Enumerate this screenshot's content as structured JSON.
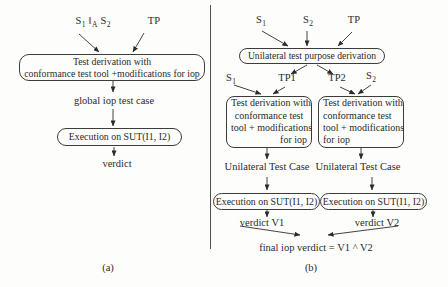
{
  "colors": {
    "ink": "#2b2b2b",
    "line": "#3c3c3c",
    "background": "#fdfdfb"
  },
  "panel_a": {
    "caption": "(a)",
    "inputs": {
      "s1": {
        "base": "S",
        "sub": "1"
      },
      "parallel": {
        "base": "‖",
        "sub": "A"
      },
      "s2": {
        "base": "S",
        "sub": "2"
      },
      "tp": "TP"
    },
    "derivation_box": {
      "line1": "Test derivation with",
      "line2": "conformance test tool +modifications for iop"
    },
    "global_test_case_label": "global iop test case",
    "execution_box_label": "Execution on SUT(I1, I2)",
    "verdict_label": "verdict"
  },
  "panel_b": {
    "caption": "(b)",
    "inputs": {
      "s1": {
        "base": "S",
        "sub": "1"
      },
      "s2": {
        "base": "S",
        "sub": "2"
      },
      "tp": "TP"
    },
    "unilateral_box_label": "Unilateral test purpose derivation",
    "tp1_label": "TP1",
    "tp2_label": "TP2",
    "mid_s1": {
      "base": "S",
      "sub": "1"
    },
    "mid_s2": {
      "base": "S",
      "sub": "2"
    },
    "derivation_left": {
      "line1": "Test derivation with",
      "line2": "conformance test",
      "line3": "tool + modifications",
      "line4": "for iop"
    },
    "derivation_right": {
      "line1": "Test derivation with",
      "line2": "conformance test",
      "line3": "tool + modifications",
      "line4": "for iop"
    },
    "unilateral_case_left": "Unilateral Test Case",
    "unilateral_case_right": "Unilateral Test Case",
    "execution_left_label": "Execution on SUT(I1, I2)",
    "execution_right_label": "Execution on SUT(I1, I2)",
    "verdict_v1_label": "verdict V1",
    "verdict_v2_label": "verdict V2",
    "final_verdict_label": "final iop verdict = V1 ^ V2"
  }
}
